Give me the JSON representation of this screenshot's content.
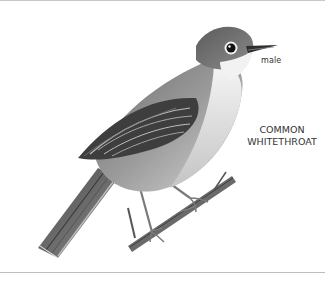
{
  "illustration": {
    "subject": "Common Whitethroat bird perched on a twig",
    "style": "grayscale pencil illustration"
  },
  "labels": {
    "sex": "male",
    "species_line1": "COMMON",
    "species_line2": "WHITETHROAT"
  },
  "colors": {
    "background": "#ffffff",
    "rule": "#c8c8c8",
    "text": "#333333"
  }
}
